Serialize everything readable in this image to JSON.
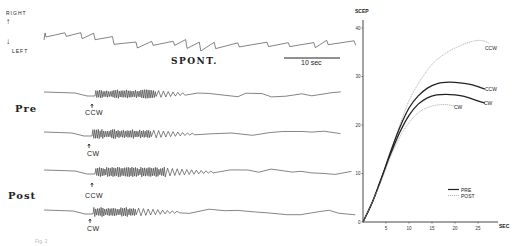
{
  "figure": {
    "direction_labels": {
      "up": "RIGHT",
      "down": "LEFT"
    },
    "spont_label": "SPONT.",
    "scale_bar_label": "10 sec",
    "rows": [
      {
        "group": "Pre",
        "traces": [
          {
            "stimulus": "CCW"
          },
          {
            "stimulus": "CW"
          }
        ]
      },
      {
        "group": "Post",
        "traces": [
          {
            "stimulus": "CCW"
          },
          {
            "stimulus": "CW"
          }
        ]
      }
    ],
    "caption_fragment": "Fig. 2"
  },
  "chart_data": {
    "type": "line",
    "title": "",
    "ylabel": "SCEP",
    "xlabel": "SEC",
    "xlim": [
      0,
      30
    ],
    "ylim": [
      0,
      40
    ],
    "x_ticks": [
      5,
      10,
      15,
      20,
      25
    ],
    "y_ticks": [
      0,
      10,
      20,
      30,
      40
    ],
    "grid": false,
    "legend": {
      "position": "lower right",
      "entries": [
        {
          "label": "PRE",
          "style": "solid"
        },
        {
          "label": "POST",
          "style": "dotted"
        }
      ]
    },
    "series": [
      {
        "name": "POST CCW",
        "condition": "POST",
        "direction": "CCW",
        "style": "dotted",
        "x": [
          0,
          2,
          4,
          6,
          8,
          10,
          12,
          15,
          18,
          21,
          24,
          26,
          27.5
        ],
        "y": [
          0,
          4,
          9,
          14.5,
          20,
          25,
          28.5,
          32.5,
          34.8,
          36.3,
          37.3,
          37.4,
          36.8
        ]
      },
      {
        "name": "PRE CCW",
        "condition": "PRE",
        "direction": "CCW",
        "style": "solid",
        "x": [
          0,
          2,
          4,
          6,
          8,
          10,
          12,
          14,
          16,
          18,
          20,
          22,
          24,
          26.5
        ],
        "y": [
          0,
          4,
          9,
          14.5,
          19.5,
          23.5,
          26,
          27.6,
          28.5,
          28.8,
          28.8,
          28.6,
          28.2,
          27.4
        ]
      },
      {
        "name": "PRE CW",
        "condition": "PRE",
        "direction": "CW",
        "style": "solid",
        "x": [
          0,
          2,
          4,
          6,
          8,
          10,
          12,
          14,
          16,
          18,
          20,
          22,
          24,
          26.5
        ],
        "y": [
          0,
          4,
          9,
          14,
          18.5,
          22,
          24.3,
          25.6,
          26.2,
          26.3,
          26.2,
          25.9,
          25.3,
          24.5
        ]
      },
      {
        "name": "POST CW",
        "condition": "POST",
        "direction": "CW",
        "style": "dotted",
        "x": [
          0,
          2,
          4,
          6,
          8,
          10,
          12,
          14,
          16,
          18,
          20
        ],
        "y": [
          0,
          4,
          8.5,
          13.5,
          17.5,
          20.5,
          22.5,
          23.6,
          24.1,
          24.2,
          23.9
        ]
      }
    ],
    "curve_labels": [
      {
        "text": "CCW",
        "series": "POST CCW"
      },
      {
        "text": "CCW",
        "series": "PRE CCW"
      },
      {
        "text": "CW",
        "series": "PRE CW"
      },
      {
        "text": "CW",
        "series": "POST CW"
      }
    ]
  }
}
